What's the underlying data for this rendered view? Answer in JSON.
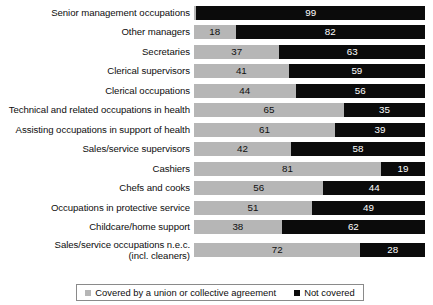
{
  "chart_data": {
    "type": "bar",
    "subtype": "stacked-horizontal-100pct",
    "title": "",
    "xlabel": "",
    "ylabel": "",
    "xlim": [
      0,
      100
    ],
    "grid": false,
    "legend_position": "bottom",
    "categories": [
      "Senior management occupations",
      "Other managers",
      "Secretaries",
      "Clerical supervisors",
      "Clerical occupations",
      "Technical and related occupations in health",
      "Assisting occupations in support of health",
      "Sales/service supervisors",
      "Cashiers",
      "Chefs and cooks",
      "Occupations in protective service",
      "Childcare/home support",
      "Sales/service occupations n.e.c.\n(incl. cleaners)"
    ],
    "series": [
      {
        "name": "Covered by a union or collective agreement",
        "color": "#b6b6b6",
        "values": [
          1,
          18,
          37,
          41,
          44,
          65,
          61,
          42,
          81,
          56,
          51,
          38,
          72
        ]
      },
      {
        "name": "Not covered",
        "color": "#0b0b0b",
        "values": [
          99,
          82,
          63,
          59,
          56,
          35,
          39,
          58,
          19,
          44,
          49,
          62,
          28
        ]
      }
    ],
    "value_labels_shown": {
      "covered": [
        "",
        "18",
        "37",
        "41",
        "44",
        "65",
        "61",
        "42",
        "81",
        "56",
        "51",
        "38",
        "72"
      ],
      "not_covered": [
        "99",
        "82",
        "63",
        "59",
        "56",
        "35",
        "39",
        "58",
        "19",
        "44",
        "49",
        "62",
        "28"
      ]
    }
  },
  "rows": [
    {
      "label": "Senior management occupations",
      "covered": 1,
      "not_covered": 99,
      "covered_label": "",
      "not_covered_label": "99",
      "two_line": false
    },
    {
      "label": "Other managers",
      "covered": 18,
      "not_covered": 82,
      "covered_label": "18",
      "not_covered_label": "82",
      "two_line": false
    },
    {
      "label": "Secretaries",
      "covered": 37,
      "not_covered": 63,
      "covered_label": "37",
      "not_covered_label": "63",
      "two_line": false
    },
    {
      "label": "Clerical supervisors",
      "covered": 41,
      "not_covered": 59,
      "covered_label": "41",
      "not_covered_label": "59",
      "two_line": false
    },
    {
      "label": "Clerical occupations",
      "covered": 44,
      "not_covered": 56,
      "covered_label": "44",
      "not_covered_label": "56",
      "two_line": false
    },
    {
      "label": "Technical and related occupations in health",
      "covered": 65,
      "not_covered": 35,
      "covered_label": "65",
      "not_covered_label": "35",
      "two_line": false
    },
    {
      "label": "Assisting occupations in support of health",
      "covered": 61,
      "not_covered": 39,
      "covered_label": "61",
      "not_covered_label": "39",
      "two_line": false
    },
    {
      "label": "Sales/service supervisors",
      "covered": 42,
      "not_covered": 58,
      "covered_label": "42",
      "not_covered_label": "58",
      "two_line": false
    },
    {
      "label": "Cashiers",
      "covered": 81,
      "not_covered": 19,
      "covered_label": "81",
      "not_covered_label": "19",
      "two_line": false
    },
    {
      "label": "Chefs and cooks",
      "covered": 56,
      "not_covered": 44,
      "covered_label": "56",
      "not_covered_label": "44",
      "two_line": false
    },
    {
      "label": "Occupations in protective service",
      "covered": 51,
      "not_covered": 49,
      "covered_label": "51",
      "not_covered_label": "49",
      "two_line": false
    },
    {
      "label": "Childcare/home support",
      "covered": 38,
      "not_covered": 62,
      "covered_label": "38",
      "not_covered_label": "62",
      "two_line": false
    },
    {
      "label": "Sales/service occupations n.e.c.\n(incl. cleaners)",
      "covered": 72,
      "not_covered": 28,
      "covered_label": "72",
      "not_covered_label": "28",
      "two_line": true
    }
  ],
  "legend": {
    "entries": [
      {
        "label": "Covered by a union or collective agreement",
        "swatch": "covered"
      },
      {
        "label": "Not covered",
        "swatch": "notcovered"
      }
    ]
  }
}
